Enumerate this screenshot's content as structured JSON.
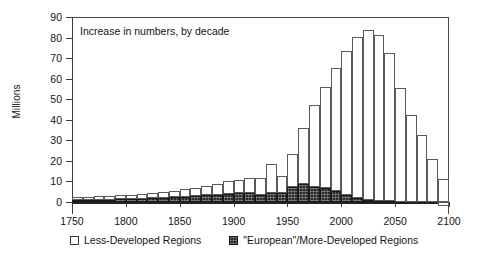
{
  "chart_data": {
    "type": "bar",
    "title": "",
    "annotation": "Increase in numbers, by decade",
    "xlabel": "",
    "ylabel": "Millions",
    "xlim": [
      1750,
      2100
    ],
    "ylim": [
      -2,
      90
    ],
    "grid": false,
    "stacked": true,
    "legend_position": "bottom",
    "x_ticks": [
      1750,
      1800,
      1850,
      1900,
      1950,
      2000,
      2050,
      2100
    ],
    "y_ticks": [
      0,
      10,
      20,
      30,
      40,
      50,
      60,
      70,
      80,
      90
    ],
    "categories": [
      "1750",
      "1760",
      "1770",
      "1780",
      "1790",
      "1800",
      "1810",
      "1820",
      "1830",
      "1840",
      "1850",
      "1860",
      "1870",
      "1880",
      "1890",
      "1900",
      "1910",
      "1920",
      "1930",
      "1940",
      "1950",
      "1960",
      "1970",
      "1980",
      "1990",
      "2000",
      "2010",
      "2020",
      "2030",
      "2040",
      "2050",
      "2060",
      "2070",
      "2080",
      "2090"
    ],
    "series": [
      {
        "name": "\"European\"/More-Developed Regions",
        "color": "#2b2b2b",
        "values": [
          1.0,
          1.0,
          1.1,
          1.2,
          1.3,
          1.4,
          1.6,
          1.8,
          2.0,
          2.2,
          2.5,
          2.8,
          3.2,
          3.6,
          4.0,
          4.3,
          4.6,
          3.4,
          4.6,
          4.4,
          7.4,
          8.8,
          7.4,
          6.6,
          5.4,
          3.6,
          2.0,
          1.1,
          0.6,
          0.3,
          0.1,
          0.0,
          0.0,
          0.0,
          0.0
        ]
      },
      {
        "name": "Less-Developed Regions",
        "color": "#ffffff",
        "values": [
          1.4,
          1.6,
          1.7,
          1.9,
          2.0,
          2.2,
          2.4,
          2.7,
          3.0,
          3.3,
          3.6,
          4.1,
          4.6,
          5.3,
          6.0,
          6.4,
          6.9,
          8.4,
          14.1,
          8.1,
          15.9,
          27.0,
          40.0,
          49.3,
          59.9,
          70.1,
          78.3,
          82.8,
          80.6,
          72.4,
          55.2,
          42.4,
          32.6,
          21.1,
          11.0
        ]
      }
    ],
    "totals": [
      2.4,
      2.6,
      2.8,
      3.1,
      3.3,
      3.6,
      4.0,
      4.5,
      5.0,
      5.5,
      6.1,
      6.9,
      7.8,
      8.9,
      10.0,
      10.7,
      11.5,
      11.8,
      18.7,
      12.5,
      23.3,
      35.8,
      47.4,
      55.9,
      65.3,
      73.7,
      80.3,
      83.9,
      81.2,
      72.7,
      55.3,
      42.4,
      32.6,
      21.1,
      11.0
    ],
    "tail_negative": {
      "category": "2090",
      "value": -1.8
    }
  },
  "axes": {
    "y_tick_labels": [
      "0",
      "10",
      "20",
      "30",
      "40",
      "50",
      "60",
      "70",
      "80",
      "90"
    ],
    "x_tick_labels": [
      "1750",
      "1800",
      "1850",
      "1900",
      "1950",
      "2000",
      "2050",
      "2100"
    ],
    "y_axis_title": "Millions"
  },
  "legend": {
    "items": [
      {
        "label": "Less-Developed Regions",
        "swatch": "light"
      },
      {
        "label": "\"European\"/More-Developed Regions",
        "swatch": "dark"
      }
    ]
  },
  "annotation": {
    "text": "Increase in numbers, by decade"
  }
}
